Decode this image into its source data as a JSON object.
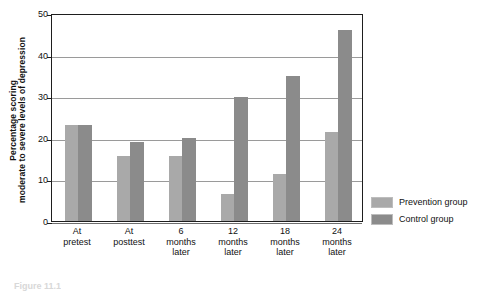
{
  "chart_data": {
    "type": "bar",
    "title": "",
    "subtitle": "",
    "xlabel": "",
    "ylabel": "Percentage scoring moderate to severe levels of depression",
    "ylabel_lines": [
      "Percentage scoring",
      "moderate to severe levels of depression"
    ],
    "categories": [
      "At pretest",
      "At posttest",
      "6 months later",
      "12 months later",
      "18 months later",
      "24 months later"
    ],
    "category_label_lines": [
      [
        "At",
        "pretest"
      ],
      [
        "At",
        "posttest"
      ],
      [
        "6",
        "months",
        "later"
      ],
      [
        "12",
        "months",
        "later"
      ],
      [
        "18",
        "months",
        "later"
      ],
      [
        "24",
        "months",
        "later"
      ]
    ],
    "series": [
      {
        "name": "Prevention group",
        "color": "#a9a9a9",
        "values": [
          23.0,
          15.7,
          15.7,
          6.5,
          11.4,
          21.5
        ]
      },
      {
        "name": "Control group",
        "color": "#8b8b8b",
        "values": [
          23.2,
          19.1,
          20.0,
          29.9,
          34.8,
          45.8
        ]
      }
    ],
    "ylim": [
      0,
      50
    ],
    "yticks": [
      0,
      10,
      20,
      30,
      40,
      50
    ],
    "ytick_labels": [
      "0",
      "10",
      "20",
      "30",
      "40",
      "50"
    ],
    "grid": true,
    "grid_axis": "y",
    "legend_position": "right",
    "legend": [
      {
        "label": "Prevention group",
        "color": "#a9a9a9"
      },
      {
        "label": "Control group",
        "color": "#8b8b8b"
      }
    ]
  },
  "caption": {
    "text": "Figure 11.1"
  },
  "colors": {
    "prevention": "#a9a9a9",
    "control": "#8b8b8b",
    "axis": "#1e1e1e",
    "gridline": "#9a9a9a",
    "background": "#ffffff"
  }
}
